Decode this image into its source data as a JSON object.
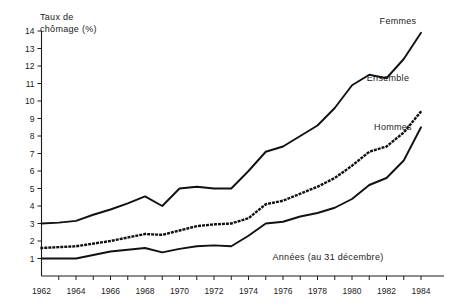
{
  "chart_data": {
    "type": "line",
    "title": "",
    "ylabel": "Taux de chômage (%)",
    "xlabel": "Années (au 31 décembre)",
    "ylim": [
      0,
      14
    ],
    "xlim": [
      1962,
      1984
    ],
    "grid": false,
    "legend_position": "right-inline",
    "y_ticks": [
      0,
      1,
      2,
      3,
      4,
      5,
      6,
      7,
      8,
      9,
      10,
      11,
      12,
      13,
      14
    ],
    "y_tick_labels": [
      "",
      "1",
      "2",
      "3",
      "4",
      "5",
      "6",
      "7",
      "8",
      "9",
      "10",
      "11",
      "12",
      "13",
      "14"
    ],
    "x_ticks": [
      1962,
      1963,
      1964,
      1965,
      1966,
      1967,
      1968,
      1969,
      1970,
      1971,
      1972,
      1973,
      1974,
      1975,
      1976,
      1977,
      1978,
      1979,
      1980,
      1981,
      1982,
      1983,
      1984
    ],
    "x_tick_labels": [
      "1962",
      "",
      "1964",
      "",
      "1966",
      "",
      "1968",
      "",
      "1970",
      "",
      "1972",
      "",
      "1974",
      "",
      "1976",
      "",
      "1978",
      "",
      "1980",
      "",
      "1982",
      "",
      "1984"
    ],
    "x": [
      1962,
      1963,
      1964,
      1965,
      1966,
      1967,
      1968,
      1969,
      1970,
      1971,
      1972,
      1973,
      1974,
      1975,
      1976,
      1977,
      1978,
      1979,
      1980,
      1981,
      1982,
      1983,
      1984
    ],
    "series": [
      {
        "name": "Femmes",
        "style": "solid",
        "label": "Femmes",
        "values": [
          3.0,
          3.05,
          3.15,
          3.5,
          3.8,
          4.15,
          4.55,
          4.0,
          5.0,
          5.1,
          5.0,
          5.0,
          6.0,
          7.1,
          7.4,
          8.0,
          8.6,
          9.6,
          10.9,
          11.5,
          11.3,
          12.4,
          13.9
        ]
      },
      {
        "name": "Ensemble",
        "style": "dotted",
        "label": "Ensemble",
        "values": [
          1.6,
          1.65,
          1.7,
          1.85,
          2.0,
          2.2,
          2.4,
          2.35,
          2.6,
          2.85,
          2.95,
          3.0,
          3.3,
          4.1,
          4.3,
          4.7,
          5.1,
          5.6,
          6.3,
          7.1,
          7.4,
          8.2,
          9.4
        ]
      },
      {
        "name": "Hommes",
        "style": "solid",
        "label": "Hommes",
        "values": [
          1.0,
          1.0,
          1.0,
          1.2,
          1.4,
          1.5,
          1.6,
          1.35,
          1.55,
          1.7,
          1.75,
          1.7,
          2.3,
          3.0,
          3.1,
          3.4,
          3.6,
          3.9,
          4.4,
          5.2,
          5.6,
          6.6,
          8.5
        ]
      }
    ]
  }
}
